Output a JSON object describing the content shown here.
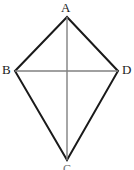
{
  "figure": {
    "kind": "geometry-diagram",
    "shape_name": "kite",
    "background_color": "#ffffff",
    "outline_color": "#1a1a1a",
    "diagonal_color": "#808080",
    "label_color": "#1a1a1a",
    "vertices": [
      {
        "id": "A",
        "label": "A",
        "x": 67,
        "y": 17,
        "position": "top"
      },
      {
        "id": "B",
        "label": "B",
        "x": 15,
        "y": 71,
        "position": "left"
      },
      {
        "id": "C",
        "label": "C",
        "x": 67,
        "y": 160,
        "position": "bottom"
      },
      {
        "id": "D",
        "label": "D",
        "x": 118,
        "y": 71,
        "position": "right"
      }
    ],
    "outline_path": "M 67 17 L 118 71 L 67 160 L 15 71 Z",
    "diagonals": [
      {
        "id": "BD",
        "label": "B-D",
        "x1": 15,
        "y1": 71,
        "x2": 118,
        "y2": 71
      },
      {
        "id": "AC",
        "label": "A-C",
        "x1": 67,
        "y1": 17,
        "x2": 67,
        "y2": 160
      }
    ],
    "intersection": {
      "x": 67,
      "y": 71
    }
  }
}
